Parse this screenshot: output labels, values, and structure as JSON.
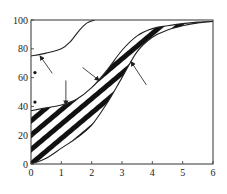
{
  "chart_data": {
    "type": "area",
    "title": "",
    "xlabel": "",
    "ylabel": "",
    "xlim": [
      0,
      6
    ],
    "ylim": [
      0,
      100
    ],
    "grid": false,
    "legend": null,
    "x_ticks": [
      "0",
      "1",
      "2",
      "3",
      "4",
      "5",
      "6"
    ],
    "y_ticks": [
      "0",
      "20",
      "40",
      "60",
      "80",
      "100"
    ],
    "series": [
      {
        "name": "upper thin curve",
        "style": "line",
        "points": [
          [
            0,
            75
          ],
          [
            0.5,
            77
          ],
          [
            1,
            80
          ],
          [
            1.3,
            85
          ],
          [
            1.6,
            93
          ],
          [
            1.85,
            98
          ],
          [
            2.1,
            100
          ]
        ]
      },
      {
        "name": "band upper boundary",
        "style": "line",
        "points": [
          [
            0,
            37
          ],
          [
            0.5,
            39
          ],
          [
            1,
            41
          ],
          [
            1.5,
            45
          ],
          [
            2,
            53
          ],
          [
            2.5,
            65
          ],
          [
            3,
            79
          ],
          [
            3.5,
            89
          ],
          [
            4,
            94
          ],
          [
            4.5,
            96
          ],
          [
            5,
            97.5
          ],
          [
            5.5,
            98.5
          ],
          [
            6,
            99
          ]
        ]
      },
      {
        "name": "band lower boundary",
        "style": "line",
        "points": [
          [
            0,
            0
          ],
          [
            0.5,
            4
          ],
          [
            1,
            11
          ],
          [
            1.5,
            18
          ],
          [
            2,
            27
          ],
          [
            2.5,
            42
          ],
          [
            3,
            60
          ],
          [
            3.5,
            78
          ],
          [
            4,
            88
          ],
          [
            4.5,
            93
          ],
          [
            5,
            96
          ],
          [
            5.5,
            98
          ],
          [
            6,
            99
          ]
        ]
      }
    ],
    "shaded_region": {
      "between": [
        "band lower boundary",
        "band upper boundary"
      ],
      "pattern": "diagonal-hatch"
    },
    "markers": [
      {
        "x": 0.13,
        "y": 63.5,
        "shape": "dot"
      },
      {
        "x": 0.13,
        "y": 43,
        "shape": "dot"
      }
    ],
    "annotations": [
      {
        "type": "arrow",
        "from": [
          0.7,
          63
        ],
        "to": [
          0.3,
          75
        ]
      },
      {
        "type": "arrow",
        "from": [
          1.15,
          58
        ],
        "to": [
          1.15,
          41
        ]
      },
      {
        "type": "arrow",
        "from": [
          1.7,
          67
        ],
        "to": [
          2.25,
          58
        ]
      },
      {
        "type": "arrow",
        "from": [
          3.8,
          55
        ],
        "to": [
          3.3,
          71
        ]
      }
    ]
  }
}
